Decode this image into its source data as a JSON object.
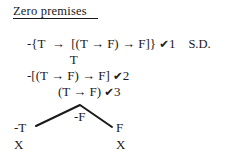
{
  "document": {
    "type": "truth-tree-proof",
    "heading": "Zero premises",
    "background_color": "#ffffff",
    "text_color": "#1a1a1a"
  },
  "proof": {
    "lines": [
      {
        "id": "line1",
        "formula": "-{T  →  [(T → F) → F]}",
        "check": "✔",
        "check_number": "1",
        "justification": "S.D."
      },
      {
        "id": "line2",
        "formula": "T",
        "check": "",
        "check_number": "",
        "justification": ""
      },
      {
        "id": "line3",
        "formula": "-[(T → F) → F]",
        "check": "✔",
        "check_number": "2",
        "justification": ""
      },
      {
        "id": "line4",
        "formula": "(T → F)",
        "check": "✔",
        "check_number": "3",
        "justification": ""
      },
      {
        "id": "line5",
        "formula": "-F",
        "check": "",
        "check_number": "",
        "justification": ""
      }
    ]
  },
  "branches": {
    "left": {
      "label": "-T",
      "close_marker": "X"
    },
    "right": {
      "label": "F",
      "close_marker": "X"
    },
    "fork_geometry": {
      "apex_x": 80,
      "apex_y": 105,
      "left_end_x": 36,
      "left_end_y": 126,
      "right_end_x": 112,
      "right_end_y": 127,
      "stroke_color": "#1a1a1a",
      "stroke_width": 2
    }
  }
}
